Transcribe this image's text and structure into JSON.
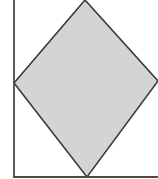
{
  "diagram": {
    "type": "geometry",
    "canvas": {
      "width": 158,
      "height": 179
    },
    "colors": {
      "background": "#ffffff",
      "rhombus_fill": "#d4d4d4",
      "rhombus_stroke": "#3a3a3a",
      "frame_stroke": "#4a4a4a"
    },
    "frame": {
      "left_x": 14,
      "bottom_y": 177,
      "left_line": {
        "x1": 14,
        "y1": 0,
        "x2": 14,
        "y2": 178
      },
      "bottom_line": {
        "x1": 14,
        "y1": 177,
        "x2": 158,
        "y2": 177
      }
    },
    "rhombus": {
      "vertices": {
        "top": [
          85,
          0
        ],
        "right": [
          158,
          81
        ],
        "bottom": [
          87,
          177
        ],
        "left": [
          14,
          83
        ]
      },
      "points": "85,0 158,81 87,177 14,83"
    }
  }
}
